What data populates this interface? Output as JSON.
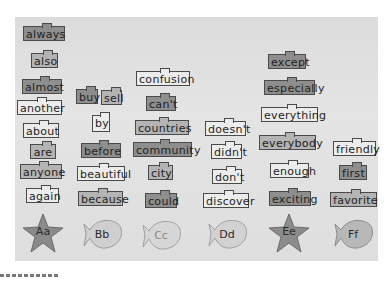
{
  "scene": {
    "description": "Grayscale photo of a classroom word wall organized alphabetically",
    "board_color": "#e0e0e0",
    "dark_card_color": "#8e8e8e",
    "light_card_color": "#ececec"
  },
  "columns": [
    {
      "letter": "Aa",
      "shape": "star",
      "words": [
        "always",
        "also",
        "almost",
        "another",
        "about",
        "are",
        "anyone",
        "again"
      ]
    },
    {
      "letter": "Bb",
      "shape": "fish",
      "words": [
        "buy",
        "sell",
        "by",
        "before",
        "beautiful",
        "because"
      ]
    },
    {
      "letter": "Cc",
      "shape": "fish",
      "words": [
        "confusion",
        "can't",
        "countries",
        "community",
        "city",
        "could"
      ]
    },
    {
      "letter": "Dd",
      "shape": "fish",
      "words": [
        "doesn't",
        "didn't",
        "don't",
        "discover"
      ]
    },
    {
      "letter": "Ee",
      "shape": "star",
      "words": [
        "except",
        "especially",
        "everything",
        "everybody",
        "enough",
        "exciting"
      ]
    },
    {
      "letter": "Ff",
      "shape": "fish",
      "words": [
        "friendly",
        "first",
        "favorite"
      ]
    }
  ]
}
